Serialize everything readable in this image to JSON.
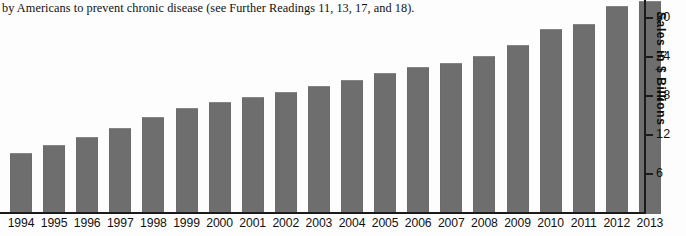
{
  "caption": {
    "text": "by Americans to prevent chronic disease (see Further Readings 11, 13, 17, and 18)."
  },
  "colors": {
    "bar": "#6e6e6e",
    "axis": "#1b1b1b",
    "text": "#111111",
    "background": "#fdfdfd"
  },
  "chart_data": {
    "type": "bar",
    "title": "",
    "xlabel": "",
    "ylabel": "Sales in $ Billions",
    "categories": [
      "1994",
      "1995",
      "1996",
      "1997",
      "1998",
      "1999",
      "2000",
      "2001",
      "2002",
      "2003",
      "2004",
      "2005",
      "2006",
      "2007",
      "2008",
      "2009",
      "2010",
      "2011",
      "2012",
      "2013"
    ],
    "values": [
      9.4,
      10.6,
      11.9,
      13.2,
      14.9,
      16.4,
      17.2,
      18.1,
      18.8,
      19.8,
      20.6,
      21.8,
      22.6,
      23.2,
      24.3,
      26.1,
      28.5,
      29.3,
      32.1,
      32.8
    ],
    "ylim": [
      0,
      32.8
    ],
    "yticks": [
      6,
      12,
      18,
      24,
      30
    ],
    "ytick_labels": [
      "6",
      "12",
      "18",
      "24",
      "30"
    ],
    "grid": false,
    "legend": null
  }
}
